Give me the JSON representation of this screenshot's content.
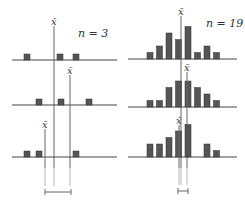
{
  "figure": {
    "colors": {
      "bar": "#555555",
      "bar_stroke": "#2e2e2e",
      "axis": "#444444",
      "mean_line": "#666666",
      "guide_line": "#b5b5b5"
    },
    "mean_symbol": "x̄",
    "left_panel": {
      "label": "n = 3",
      "rows": [
        {
          "baseline_y": 60,
          "squares_x": [
            24,
            57,
            73
          ],
          "mean_x": 54,
          "mean_label_y": 22,
          "mean_line_top": 26
        },
        {
          "baseline_y": 105,
          "squares_x": [
            36,
            58,
            86
          ],
          "mean_x": 70,
          "mean_label_y": 71,
          "mean_line_top": 75
        },
        {
          "baseline_y": 157,
          "squares_x": [
            24,
            36,
            73
          ],
          "mean_x": 45,
          "mean_label_y": 125,
          "mean_line_top": 129
        }
      ],
      "spread_bracket": {
        "x1": 45,
        "x2": 71,
        "y": 192
      }
    },
    "right_panel": {
      "label": "n = 19",
      "bar_slots_x": [
        147,
        156.5,
        166,
        175.5,
        185,
        194.5,
        204,
        213.5
      ],
      "rows": [
        {
          "baseline_y": 59,
          "heights": [
            1,
            2,
            4,
            3,
            5,
            1,
            2,
            1
          ],
          "mean_x": 181,
          "mean_label_y": 12,
          "mean_line_top": 16
        },
        {
          "baseline_y": 107,
          "heights": [
            1,
            1,
            3,
            4,
            4,
            3,
            2,
            1
          ],
          "mean_x": 187,
          "mean_label_y": 68,
          "mean_line_top": 72
        },
        {
          "baseline_y": 157,
          "heights": [
            2,
            2,
            3,
            4,
            5,
            0,
            2,
            1
          ],
          "mean_x": 179,
          "mean_label_y": 121,
          "mean_line_top": 125
        }
      ],
      "spread_bracket": {
        "x1": 178,
        "x2": 188,
        "y": 191
      }
    }
  }
}
